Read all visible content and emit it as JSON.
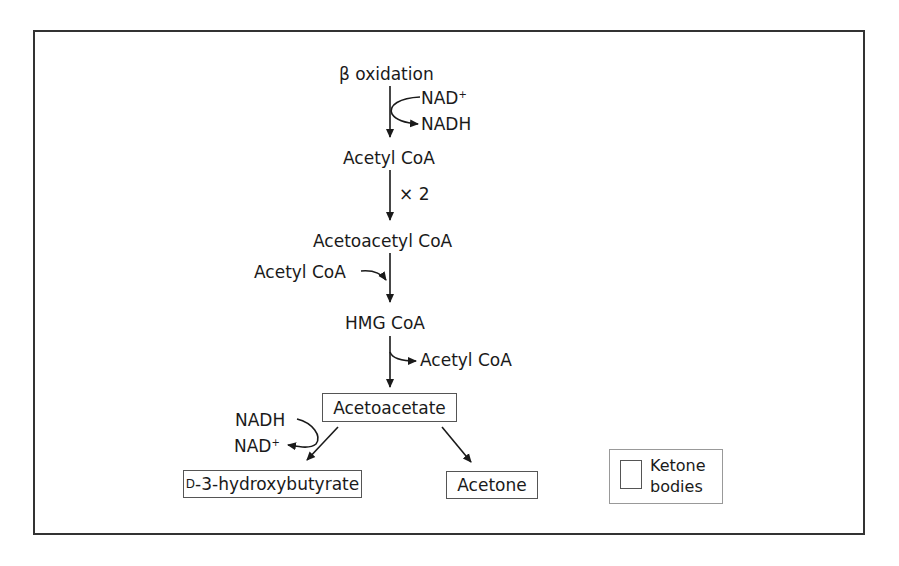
{
  "diagram": {
    "type": "metabolic-pathway",
    "nodes": {
      "beta_oxidation": "β oxidation",
      "acetyl_coa_1": "Acetyl CoA",
      "acetoacetyl_coa": "Acetoacetyl CoA",
      "hmg_coa": "HMG CoA",
      "acetoacetate": "Acetoacetate",
      "hydroxybutyrate_prefix": "D",
      "hydroxybutyrate": "-3-hydroxybutyrate",
      "acetone": "Acetone"
    },
    "side_labels": {
      "nad_plus_1": "NAD",
      "nad_plus_1_sup": "+",
      "nadh_1": "NADH",
      "times_two": "× 2",
      "acetyl_coa_in": "Acetyl CoA",
      "acetyl_coa_out": "Acetyl CoA",
      "nadh_2": "NADH",
      "nad_plus_2": "NAD",
      "nad_plus_2_sup": "+"
    },
    "edges": [
      {
        "from": "β oxidation",
        "to": "Acetyl CoA",
        "cofactor_in": "NAD+",
        "cofactor_out": "NADH"
      },
      {
        "from": "Acetyl CoA",
        "to": "Acetoacetyl CoA",
        "label": "× 2"
      },
      {
        "from": "Acetoacetyl CoA",
        "to": "HMG CoA",
        "input": "Acetyl CoA"
      },
      {
        "from": "HMG CoA",
        "to": "Acetoacetate",
        "output": "Acetyl CoA"
      },
      {
        "from": "Acetoacetate",
        "to": "D-3-hydroxybutyrate",
        "cofactor_in": "NADH",
        "cofactor_out": "NAD+"
      },
      {
        "from": "Acetoacetate",
        "to": "Acetone"
      }
    ],
    "legend": {
      "line1": "Ketone",
      "line2": "bodies",
      "meaning": "Boxed items are ketone bodies"
    }
  }
}
